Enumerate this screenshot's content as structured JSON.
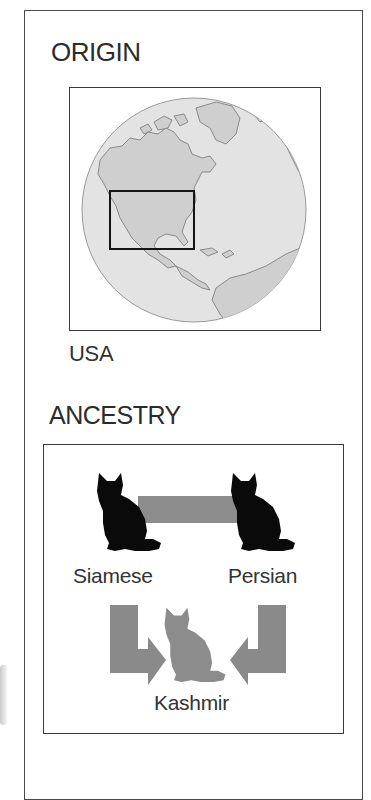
{
  "origin": {
    "heading": "ORIGIN",
    "map": {
      "icon": "globe-icon",
      "highlight_region": "continental-usa",
      "colors": {
        "ocean": "#e2e2e2",
        "land": "#cfcfcf",
        "coast": "#8a8a8a",
        "highlight_box": "#1a1a1a"
      }
    },
    "country": "USA"
  },
  "ancestry": {
    "heading": "ANCESTRY",
    "parents": [
      {
        "name": "Siamese",
        "icon": "cat-silhouette-icon",
        "color": "#0a0a0a"
      },
      {
        "name": "Persian",
        "icon": "cat-silhouette-icon",
        "color": "#0a0a0a"
      }
    ],
    "connector_color": "#8c8c8c",
    "offspring": {
      "name": "Kashmir",
      "icon": "cat-silhouette-icon",
      "color": "#8c8c8c"
    },
    "arrow_color": "#8a8a8a"
  }
}
